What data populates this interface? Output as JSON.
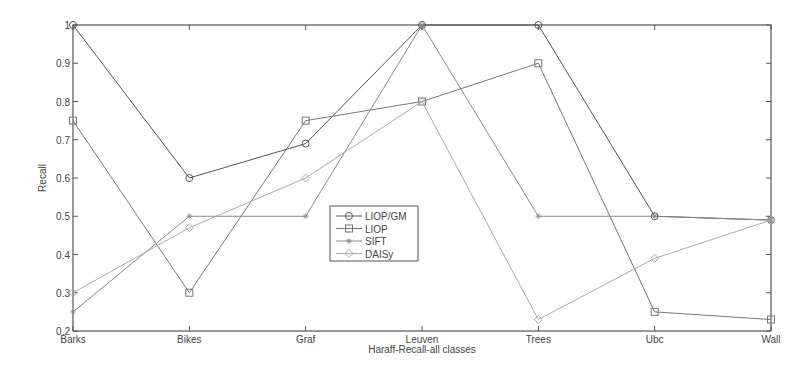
{
  "chart_data": {
    "type": "line",
    "title": "",
    "xlabel": "Haraff-Recall-all classes",
    "ylabel": "Recall",
    "categories": [
      "Barks",
      "Bikes",
      "Graf",
      "Leuven",
      "Trees",
      "Ubc",
      "Wall"
    ],
    "ylim": [
      0.2,
      1.0
    ],
    "yticks": [
      "0.2",
      "0.3",
      "0.4",
      "0.5",
      "0.6",
      "0.7",
      "0.8",
      "0.9",
      "1"
    ],
    "grid": false,
    "legend_position": "center",
    "series": [
      {
        "name": "LIOP/GM",
        "marker": "circle",
        "color": "#555555",
        "values": [
          1.0,
          0.6,
          0.69,
          1.0,
          1.0,
          0.5,
          0.49
        ]
      },
      {
        "name": "LIOP",
        "marker": "square",
        "color": "#777777",
        "values": [
          0.75,
          0.3,
          0.75,
          0.8,
          0.9,
          0.25,
          0.23
        ]
      },
      {
        "name": "SIFT",
        "marker": "asterisk",
        "color": "#888888",
        "values": [
          0.25,
          0.5,
          0.5,
          1.0,
          0.5,
          0.5,
          0.49
        ]
      },
      {
        "name": "DAISy",
        "marker": "diamond",
        "color": "#aaaaaa",
        "values": [
          0.3,
          0.47,
          0.6,
          0.8,
          0.23,
          0.39,
          0.49
        ]
      }
    ]
  }
}
